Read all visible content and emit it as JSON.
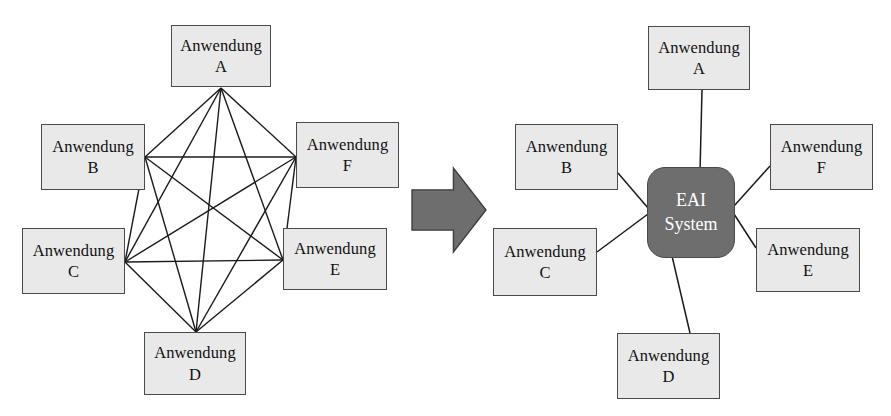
{
  "figure": {
    "title": "EAI Punkt-zu-Punkt Integration vs. EAI System Hub",
    "background_color": "#ffffff"
  },
  "colors": {
    "box_fill": "#e9e9e9",
    "box_border": "#4a4a4a",
    "hub_fill": "#6e6e6e",
    "hub_text": "#ffffff",
    "arrow_fill": "#6e6e6e",
    "arrow_border": "#3f3f3f",
    "edge_line": "#1a1a1a"
  },
  "labels": {
    "application_prefix": "Anwendung",
    "hub_line1": "EAI",
    "hub_line2": "System"
  },
  "left_panel": {
    "name": "point-to-point-mesh",
    "topology": "complete-graph-k6",
    "edge_count": 15,
    "nodes": [
      {
        "id": "A",
        "line1": "Anwendung",
        "line2": "A",
        "x": 171,
        "y": 25,
        "w": 100,
        "h": 62,
        "hub_x": 221,
        "hub_y": 88
      },
      {
        "id": "B",
        "line1": "Anwendung",
        "line2": "B",
        "x": 41,
        "y": 124,
        "w": 104,
        "h": 66,
        "hub_x": 145,
        "hub_y": 157
      },
      {
        "id": "C",
        "line1": "Anwendung",
        "line2": "C",
        "x": 22,
        "y": 228,
        "w": 103,
        "h": 66,
        "hub_x": 125,
        "hub_y": 262
      },
      {
        "id": "D",
        "line1": "Anwendung",
        "line2": "D",
        "x": 144,
        "y": 332,
        "w": 102,
        "h": 63,
        "hub_x": 196,
        "hub_y": 332
      },
      {
        "id": "E",
        "line1": "Anwendung",
        "line2": "E",
        "x": 283,
        "y": 228,
        "w": 104,
        "h": 62,
        "hub_x": 283,
        "hub_y": 260
      },
      {
        "id": "F",
        "line1": "Anwendung",
        "line2": "F",
        "x": 296,
        "y": 122,
        "w": 103,
        "h": 66,
        "hub_x": 296,
        "hub_y": 157
      }
    ],
    "edges": [
      [
        "A",
        "B"
      ],
      [
        "A",
        "C"
      ],
      [
        "A",
        "D"
      ],
      [
        "A",
        "E"
      ],
      [
        "A",
        "F"
      ],
      [
        "B",
        "C"
      ],
      [
        "B",
        "D"
      ],
      [
        "B",
        "E"
      ],
      [
        "B",
        "F"
      ],
      [
        "C",
        "D"
      ],
      [
        "C",
        "E"
      ],
      [
        "C",
        "F"
      ],
      [
        "D",
        "E"
      ],
      [
        "D",
        "F"
      ],
      [
        "E",
        "F"
      ]
    ]
  },
  "transition_arrow": {
    "name": "transformation-arrow",
    "direction": "right",
    "x": 412,
    "y": 168,
    "w": 74,
    "h": 84
  },
  "right_panel": {
    "name": "eai-hub-and-spoke",
    "topology": "hub-and-spoke",
    "edge_count": 6,
    "hub": {
      "id": "EAI",
      "line1": "EAI",
      "line2": "System",
      "x": 647,
      "y": 167,
      "w": 88,
      "h": 91
    },
    "nodes": [
      {
        "id": "A",
        "line1": "Anwendung",
        "line2": "A",
        "x": 648,
        "y": 26,
        "w": 102,
        "h": 64,
        "port_x": 702,
        "port_y": 90,
        "hub_x": 700,
        "hub_y": 172
      },
      {
        "id": "B",
        "line1": "Anwendung",
        "line2": "B",
        "x": 515,
        "y": 124,
        "w": 103,
        "h": 66,
        "port_x": 618,
        "port_y": 173,
        "hub_x": 648,
        "hub_y": 208
      },
      {
        "id": "C",
        "line1": "Anwendung",
        "line2": "C",
        "x": 493,
        "y": 228,
        "w": 104,
        "h": 68,
        "port_x": 597,
        "port_y": 252,
        "hub_x": 648,
        "hub_y": 214
      },
      {
        "id": "D",
        "line1": "Anwendung",
        "line2": "D",
        "x": 617,
        "y": 333,
        "w": 103,
        "h": 66,
        "port_x": 690,
        "port_y": 333,
        "hub_x": 672,
        "hub_y": 256
      },
      {
        "id": "E",
        "line1": "Anwendung",
        "line2": "E",
        "x": 756,
        "y": 228,
        "w": 104,
        "h": 64,
        "port_x": 756,
        "port_y": 248,
        "hub_x": 734,
        "hub_y": 214
      },
      {
        "id": "F",
        "line1": "Anwendung",
        "line2": "F",
        "x": 770,
        "y": 124,
        "w": 103,
        "h": 66,
        "port_x": 770,
        "port_y": 166,
        "hub_x": 734,
        "hub_y": 206
      }
    ]
  }
}
